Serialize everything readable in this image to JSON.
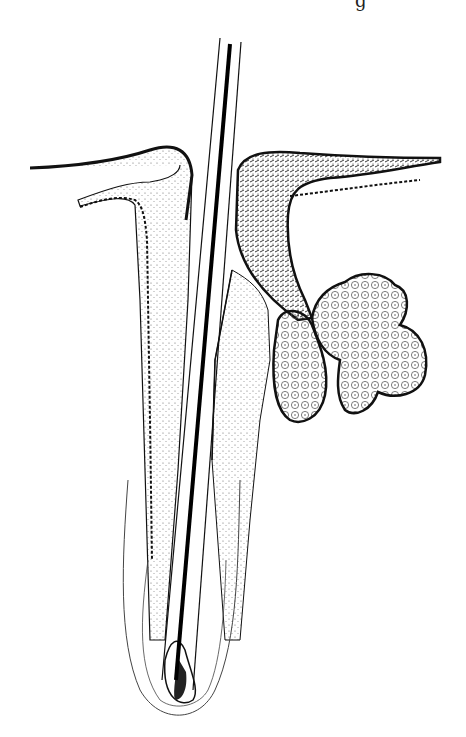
{
  "figure": {
    "style": "black ink histology illustration",
    "cut_text": "g",
    "colors": {
      "ink": "#111111",
      "background": "#ffffff",
      "stipple": "#555555"
    }
  }
}
